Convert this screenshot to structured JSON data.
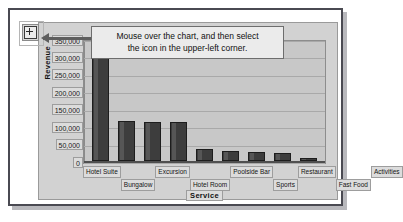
{
  "tooltip": {
    "line1": "Mouse over the chart, and then select",
    "line2": "the icon in the upper-left corner."
  },
  "icons": {
    "chart_tool": "chart-quick-analysis-icon",
    "leader_arrow": "arrow-left-icon"
  },
  "chart_data": {
    "type": "bar",
    "title": "",
    "xlabel": "Service",
    "ylabel": "Revenue",
    "ylim": [
      0,
      350000
    ],
    "ytick_labels": [
      "350,000",
      "300,000",
      "250,000",
      "200,000",
      "150,000",
      "100,000",
      "50,000",
      "0"
    ],
    "ytick_values": [
      350000,
      300000,
      250000,
      200000,
      150000,
      100000,
      50000,
      0
    ],
    "grid": true,
    "legend": "none",
    "bar_color": "#3d3d3d",
    "plot_background": "#c8c8c8",
    "categories": [
      "Hotel Suite",
      "Bungalow",
      "Excursion",
      "Hotel Room",
      "Poolside Bar",
      "Sports",
      "Restaurant",
      "Fast Food",
      "Activities"
    ],
    "values": [
      340000,
      115000,
      113000,
      113000,
      35000,
      30000,
      26000,
      24000,
      8000
    ]
  }
}
